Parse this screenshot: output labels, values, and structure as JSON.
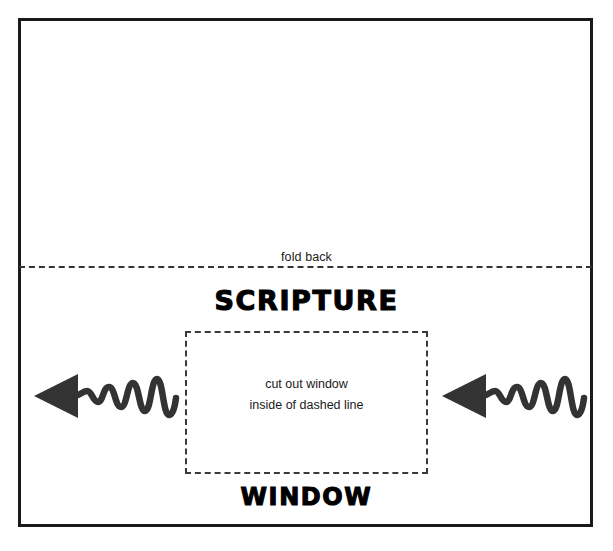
{
  "document": {
    "type": "craft-template",
    "fold": {
      "label": "fold back",
      "line_style": "dashed"
    },
    "headings": {
      "top": "SCRIPTURE",
      "bottom": "WINDOW"
    },
    "cutout": {
      "line_style": "dashed",
      "instruction_line_1": "cut out window",
      "instruction_line_2": "inside of dashed line"
    },
    "arrows": {
      "left": {
        "name": "squiggly-arrow-left",
        "direction": "left",
        "style": "wavy"
      },
      "right": {
        "name": "squiggly-arrow-right",
        "direction": "left",
        "style": "wavy"
      }
    },
    "colors": {
      "ink": "#1a1a1a",
      "dash": "#3a3a3a",
      "paper": "#ffffff"
    }
  }
}
